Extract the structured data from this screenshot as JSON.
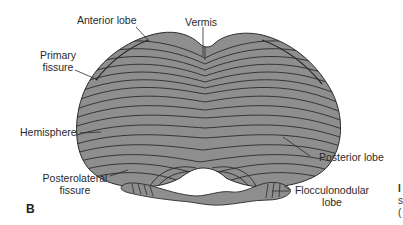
{
  "figure": {
    "panel_label": "B",
    "fill_color": "#8e8e8e",
    "line_color": "#2b2b2b"
  },
  "labels": {
    "anterior_lobe": "Anterior lobe",
    "vermis": "Vermis",
    "primary_fissure_line1": "Primary",
    "primary_fissure_line2": "fissure",
    "hemisphere": "Hemisphere",
    "posterolateral_fissure_line1": "Posterolateral",
    "posterolateral_fissure_line2": "fissure",
    "posterior_lobe": "Posterior lobe",
    "flocculonodular_line1": "Flocculonodular",
    "flocculonodular_line2": "lobe"
  },
  "edge_fragment": {
    "line1": "I",
    "line2": "s",
    "line3": "("
  }
}
